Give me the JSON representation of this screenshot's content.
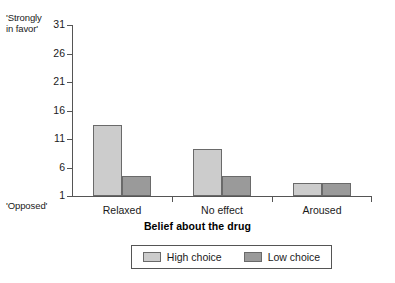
{
  "chart_data": {
    "type": "bar",
    "title": "",
    "xlabel": "Belief about the drug",
    "ylabel": "",
    "categories": [
      "Relaxed",
      "No effect",
      "Aroused"
    ],
    "series": [
      {
        "name": "High choice",
        "values": [
          13.5,
          9.2,
          3.2
        ],
        "color": "#cccccc"
      },
      {
        "name": "Low choice",
        "values": [
          4.5,
          4.5,
          3.3
        ],
        "color": "#9a9a9a"
      }
    ],
    "ylim": [
      1,
      31
    ],
    "yticks": [
      1,
      6,
      11,
      16,
      21,
      26,
      31
    ],
    "ytick_labels": [
      "1",
      "6",
      "11",
      "16",
      "21",
      "26",
      "31"
    ],
    "y_axis_anchor_high": "'Strongly\nin favor'",
    "y_axis_anchor_low": "'Opposed'",
    "grid": false,
    "legend_position": "bottom"
  },
  "axis": {
    "anchor_top": "'Strongly\nin favor'",
    "anchor_bottom": "'Opposed'",
    "x_title": "Belief about the drug"
  },
  "legend": {
    "items": [
      {
        "label": "High choice",
        "swatch": "high"
      },
      {
        "label": "Low choice",
        "swatch": "low"
      }
    ]
  }
}
